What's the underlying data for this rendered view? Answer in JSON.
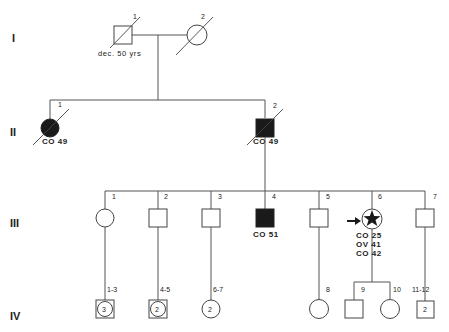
{
  "generations": [
    {
      "roman": "I",
      "members": [
        {
          "id": "I-1",
          "num": "1",
          "sex": "male",
          "affected": false,
          "deceased": true,
          "note": "dec. 50 yrs"
        },
        {
          "id": "I-2",
          "num": "2",
          "sex": "female",
          "affected": false,
          "deceased": true
        }
      ]
    },
    {
      "roman": "II",
      "members": [
        {
          "id": "II-1",
          "num": "1",
          "sex": "female",
          "affected": true,
          "deceased": true,
          "labels": [
            "CO 49"
          ]
        },
        {
          "id": "II-2",
          "num": "2",
          "sex": "male",
          "affected": true,
          "deceased": true,
          "labels": [
            "CO 49"
          ]
        }
      ]
    },
    {
      "roman": "III",
      "members": [
        {
          "id": "III-1",
          "num": "1",
          "sex": "female",
          "affected": false
        },
        {
          "id": "III-2",
          "num": "2",
          "sex": "male",
          "affected": false
        },
        {
          "id": "III-3",
          "num": "3",
          "sex": "male",
          "affected": false
        },
        {
          "id": "III-4",
          "num": "4",
          "sex": "male",
          "affected": true,
          "labels": [
            "CO 51"
          ]
        },
        {
          "id": "III-5",
          "num": "5",
          "sex": "male",
          "affected": false
        },
        {
          "id": "III-6",
          "num": "6",
          "sex": "female",
          "affected": true,
          "proband": true,
          "marker": "star",
          "labels": [
            "CO 25",
            "OV 41",
            "CO 42"
          ]
        },
        {
          "id": "III-7",
          "num": "7",
          "sex": "male",
          "affected": false
        }
      ]
    },
    {
      "roman": "IV",
      "members": [
        {
          "id": "IV-1-3",
          "num": "1-3",
          "sex": "unknown",
          "count": "3"
        },
        {
          "id": "IV-4-5",
          "num": "4-5",
          "sex": "unknown",
          "count": "2"
        },
        {
          "id": "IV-6-7",
          "num": "6-7",
          "sex": "female",
          "count": "2"
        },
        {
          "id": "IV-8",
          "num": "8",
          "sex": "female"
        },
        {
          "id": "IV-9",
          "num": "9",
          "sex": "male"
        },
        {
          "id": "IV-10",
          "num": "10",
          "sex": "female"
        },
        {
          "id": "IV-11-12",
          "num": "11-12",
          "sex": "male",
          "count": "2"
        }
      ]
    }
  ],
  "colors": {
    "line": "#555555",
    "affected": "#1a1a1a",
    "background": "#ffffff"
  }
}
